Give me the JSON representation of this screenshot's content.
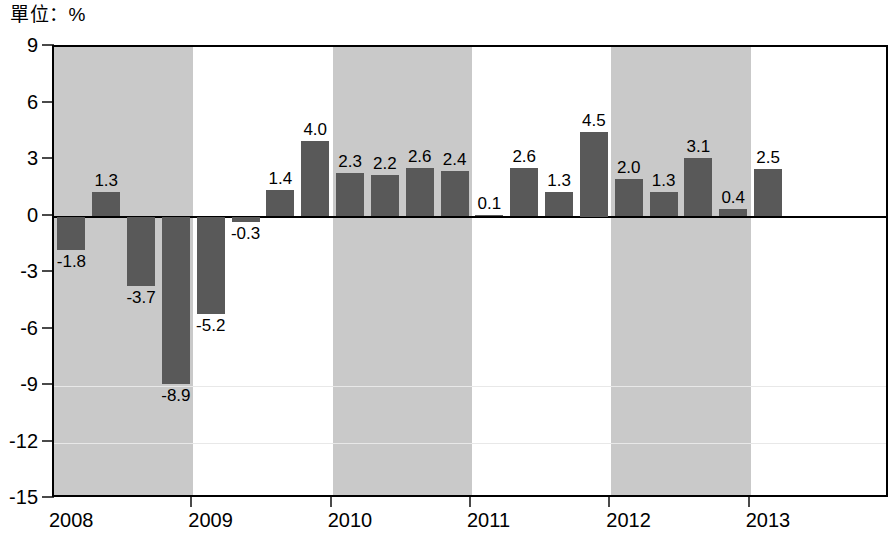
{
  "unit_label": "單位：%",
  "colors": {
    "bar": "#595959",
    "band": "#c9c9c9",
    "axis": "#000000",
    "grid": "#e8e8e8",
    "background": "#ffffff"
  },
  "chart_data": {
    "type": "bar",
    "title": "",
    "subtitle": "",
    "xlabel": "",
    "ylabel": "單位：%",
    "ylim": [
      -15,
      9
    ],
    "yticks": [
      9,
      6,
      3,
      0,
      -3,
      -6,
      -9,
      -12,
      -15
    ],
    "ytick_labels": [
      "9",
      "6",
      "3",
      "0",
      "-3",
      "-6",
      "-9",
      "-12",
      "-15"
    ],
    "grid": false,
    "legend": "none",
    "zero_line": true,
    "shaded_year_bands": [
      "2008",
      "2010",
      "2012"
    ],
    "xticks": [
      "2008",
      "2009",
      "2010",
      "2011",
      "2012",
      "2013"
    ],
    "categories": [
      "2008Q1",
      "2008Q2",
      "2008Q3",
      "2008Q4",
      "2009Q1",
      "2009Q2",
      "2009Q3",
      "2009Q4",
      "2010Q1",
      "2010Q2",
      "2010Q3",
      "2010Q4",
      "2011Q1",
      "2011Q2",
      "2011Q3",
      "2011Q4",
      "2012Q1",
      "2012Q2",
      "2012Q3",
      "2012Q4",
      "2013Q1"
    ],
    "values": [
      -1.8,
      1.3,
      -3.7,
      -8.9,
      -5.2,
      -0.3,
      1.4,
      4.0,
      2.3,
      2.2,
      2.6,
      2.4,
      0.1,
      2.6,
      1.3,
      4.5,
      2.0,
      1.3,
      3.1,
      0.4,
      2.5
    ],
    "value_labels": [
      "-1.8",
      "1.3",
      "-3.7",
      "-8.9",
      "-5.2",
      "-0.3",
      "1.4",
      "4.0",
      "2.3",
      "2.2",
      "2.6",
      "2.4",
      "0.1",
      "2.6",
      "1.3",
      "4.5",
      "2.0",
      "1.3",
      "3.1",
      "0.4",
      "2.5"
    ]
  }
}
